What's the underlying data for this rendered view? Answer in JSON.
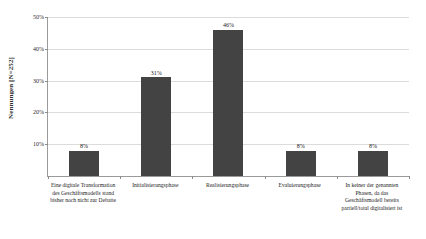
{
  "chart_data": {
    "type": "bar",
    "title": "",
    "xlabel": "",
    "ylabel": "Nennungen [N=252]",
    "ylim": [
      0,
      50
    ],
    "grid": true,
    "legend": "none",
    "categories": [
      "Eine digitale Transformation des Geschäftsmodells stand bisher noch nicht zur Debatte",
      "Initialisierungsphase",
      "Realisierungsphase",
      "Evaluierungsphase",
      "In keiner der genannten Phasen, da das Geschäftsmodell bereits partiell/total digitalisiert ist"
    ],
    "values": [
      8,
      31,
      46,
      8,
      8
    ],
    "value_labels": [
      "8%",
      "31%",
      "46%",
      "8%",
      "8%"
    ],
    "ytick_labels": [
      "10%",
      "20%",
      "30%",
      "40%",
      "50%"
    ],
    "ytick_values": [
      10,
      20,
      30,
      40,
      50
    ],
    "bar_color": "#434343",
    "grid_color": "#dcdcdc",
    "axis_color": "#9a9a9a"
  }
}
